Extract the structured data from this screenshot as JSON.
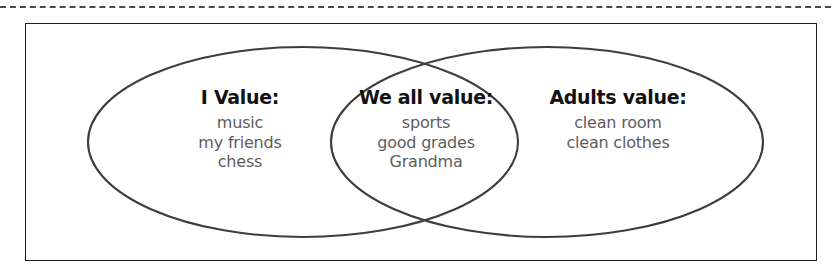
{
  "page": {
    "background_color": "#fefefe",
    "cut_line": {
      "style": "dashed",
      "color": "#4a4a4a",
      "label": "cut-here-dashed-line"
    },
    "border_box": {
      "color": "#1c1c1c"
    }
  },
  "diagram": {
    "type": "venn-two-set",
    "stroke_color": "#3d3d3d",
    "title_color": "#121212",
    "item_color": "#5d5d5d",
    "circles": [
      {
        "name": "left-set",
        "cx": 303,
        "cy": 142,
        "rx": 215,
        "ry": 95
      },
      {
        "name": "right-set",
        "cx": 547,
        "cy": 142,
        "rx": 216,
        "ry": 95
      }
    ],
    "groups": [
      {
        "id": "left",
        "title": "I Value:",
        "items": [
          "music",
          "my friends",
          "chess"
        ]
      },
      {
        "id": "middle",
        "title": "We all value:",
        "items": [
          "sports",
          "good grades",
          "Grandma"
        ]
      },
      {
        "id": "right",
        "title": "Adults value:",
        "items": [
          "clean room",
          "clean clothes"
        ]
      }
    ]
  }
}
